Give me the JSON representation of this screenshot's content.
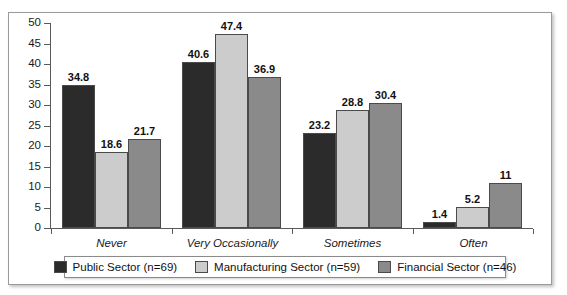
{
  "chart_data": {
    "type": "bar",
    "title": "",
    "subtitle": "",
    "xlabel": "",
    "ylabel": "",
    "categories": [
      "Never",
      "Very Occasionally",
      "Sometimes",
      "Often"
    ],
    "series": [
      {
        "name": "Public Sector (n=69)",
        "color": "#2b2b2b",
        "values": [
          34.8,
          40.6,
          23.2,
          1.4
        ],
        "labels": [
          "34.8",
          "40.6",
          "23.2",
          "1.4"
        ]
      },
      {
        "name": "Manufacturing Sector (n=59)",
        "color": "#cccccc",
        "values": [
          18.6,
          47.4,
          28.8,
          5.2
        ],
        "labels": [
          "18.6",
          "47.4",
          "28.8",
          "5.2"
        ]
      },
      {
        "name": "Financial Sector (n=46)",
        "color": "#8a8a8a",
        "values": [
          21.7,
          36.9,
          30.4,
          11
        ],
        "labels": [
          "21.7",
          "36.9",
          "30.4",
          "11"
        ]
      }
    ],
    "ylim": [
      0,
      50
    ],
    "ytick_step": 5,
    "yticks": [
      "50",
      "45",
      "40",
      "35",
      "30",
      "25",
      "20",
      "15",
      "10",
      "5",
      "0"
    ],
    "grid": false,
    "legend_position": "bottom",
    "legend": [
      "Public Sector (n=69)",
      "Manufacturing Sector (n=59)",
      "Financial Sector (n=46)"
    ]
  }
}
